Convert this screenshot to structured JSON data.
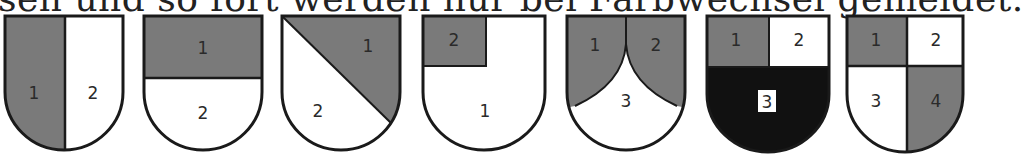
{
  "caption": "sen und so fort werden nur bei Farbwechsel gemeldet.",
  "colors": {
    "gray": "#7a7a7a",
    "white": "#ffffff",
    "black": "#111111",
    "stroke": "#1a1a1a"
  },
  "shields": [
    {
      "name": "per-pale",
      "description": "Vertical split",
      "labels": [
        "1",
        "2"
      ]
    },
    {
      "name": "per-fess",
      "description": "Horizontal split",
      "labels": [
        "1",
        "2"
      ]
    },
    {
      "name": "per-bend-sinister",
      "description": "Diagonal split",
      "labels": [
        "1",
        "2"
      ]
    },
    {
      "name": "canton",
      "description": "Top-left canton",
      "labels": [
        "2",
        "1"
      ]
    },
    {
      "name": "chape-ploye",
      "description": "Two curved upper fields, lower point",
      "labels": [
        "1",
        "2",
        "3"
      ]
    },
    {
      "name": "per-pale-and-per-fess-with-black-base",
      "description": "Two upper quarters, black base",
      "labels": [
        "1",
        "2",
        "3"
      ]
    },
    {
      "name": "quarterly",
      "description": "Four quarters",
      "labels": [
        "1",
        "2",
        "3",
        "4"
      ]
    }
  ]
}
